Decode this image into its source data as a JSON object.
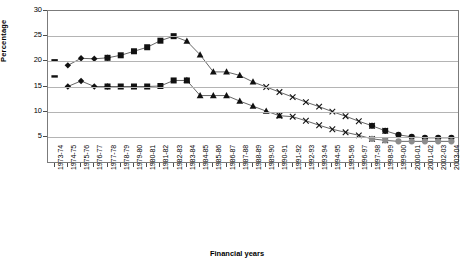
{
  "chart_data": {
    "type": "line",
    "title": "",
    "xlabel": "Financial years",
    "ylabel": "Percentage",
    "ylim": [
      0,
      30
    ],
    "yticks": [
      5,
      10,
      15,
      20,
      25,
      30
    ],
    "grid": true,
    "legend": "none",
    "categories": [
      "1973-74",
      "1974-75",
      "1975-76",
      "1976-77",
      "1977-78",
      "1978-79",
      "1979-80",
      "1980-81",
      "1981-82",
      "1982-83",
      "1983-84",
      "1984-85",
      "1985-86",
      "1986-87",
      "1987-88",
      "1988-89",
      "1989-90",
      "1990-91",
      "1991-92",
      "1992-93",
      "1993-94",
      "1994-95",
      "1995-96",
      "1996-97",
      "1997-98",
      "1998-99",
      "1999-00",
      "2000-01",
      "2001-02",
      "2002-03",
      "2003-04"
    ],
    "series": [
      {
        "name": "upper-series",
        "marker": "mixed",
        "values": [
          20.2,
          19.2,
          20.6,
          20.5,
          20.7,
          21.2,
          22.0,
          22.8,
          24.1,
          25.0,
          24.0,
          21.3,
          17.9,
          17.9,
          17.2,
          15.9,
          14.9,
          13.9,
          12.9,
          11.9,
          11.0,
          10.0,
          9.1,
          8.1,
          7.2,
          6.2,
          5.4,
          5.0,
          4.8,
          4.8,
          4.8
        ],
        "marker_segments": [
          {
            "marker": "dash",
            "from": 0,
            "to": 0
          },
          {
            "marker": "diamond",
            "from": 1,
            "to": 4
          },
          {
            "marker": "square",
            "from": 4,
            "to": 9
          },
          {
            "marker": "triangle",
            "from": 10,
            "to": 15
          },
          {
            "marker": "cross",
            "from": 16,
            "to": 25
          },
          {
            "marker": "circle",
            "from": 24,
            "to": 30
          }
        ]
      },
      {
        "name": "lower-series",
        "marker": "mixed",
        "values": [
          17.0,
          15.0,
          16.1,
          15.0,
          15.0,
          15.0,
          15.0,
          15.0,
          15.1,
          16.2,
          16.2,
          13.2,
          13.2,
          13.2,
          12.1,
          11.1,
          10.1,
          9.2,
          9.0,
          8.2,
          7.3,
          6.5,
          5.9,
          5.3,
          4.6,
          4.3,
          4.1,
          4.1,
          4.1,
          4.1,
          4.1
        ],
        "marker_segments": [
          {
            "marker": "dash",
            "from": 0,
            "to": 0
          },
          {
            "marker": "diamond",
            "from": 1,
            "to": 4
          },
          {
            "marker": "square",
            "from": 4,
            "to": 10
          },
          {
            "marker": "triangle",
            "from": 10,
            "to": 17
          },
          {
            "marker": "cross",
            "from": 17,
            "to": 25
          },
          {
            "marker": "circle",
            "from": 24,
            "to": 30
          }
        ],
        "marker_color_late": "#8c8c8c"
      }
    ]
  }
}
